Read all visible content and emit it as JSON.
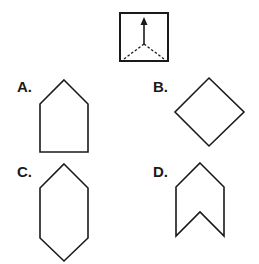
{
  "question": {
    "figure": "square-with-dashed-fold-lines-and-arrow",
    "stroke_color": "#1a1a1a"
  },
  "options": [
    {
      "letter": "A.",
      "shape": "pentagon-house"
    },
    {
      "letter": "B.",
      "shape": "diamond"
    },
    {
      "letter": "C.",
      "shape": "elongated-hexagon"
    },
    {
      "letter": "D.",
      "shape": "chevron-notched"
    }
  ]
}
